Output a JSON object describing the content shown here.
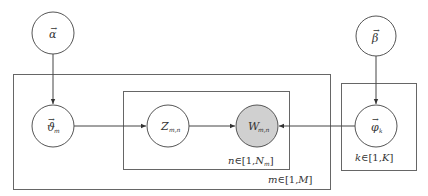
{
  "diagram": {
    "type": "plate-notation-graphical-model",
    "nodes": {
      "alpha": {
        "symbol": "α",
        "vector": true,
        "subscript": "",
        "observed": false
      },
      "beta": {
        "symbol": "β",
        "vector": true,
        "subscript": "",
        "observed": false
      },
      "theta": {
        "symbol": "ϑ",
        "vector": true,
        "subscript": "m",
        "observed": false
      },
      "z": {
        "symbol": "Z",
        "vector": false,
        "subscript": "m,n",
        "observed": false
      },
      "w": {
        "symbol": "W",
        "vector": false,
        "subscript": "m,n",
        "observed": true
      },
      "phi": {
        "symbol": "φ",
        "vector": true,
        "subscript": "k",
        "observed": false
      }
    },
    "vector_arrow": "→",
    "edges": [
      {
        "from": "alpha",
        "to": "theta"
      },
      {
        "from": "theta",
        "to": "z"
      },
      {
        "from": "z",
        "to": "w"
      },
      {
        "from": "beta",
        "to": "phi"
      },
      {
        "from": "phi",
        "to": "w"
      }
    ],
    "plates": {
      "outer": {
        "label_var": "m",
        "label_range": "∈[1,",
        "label_end": "M",
        "label_close": "]"
      },
      "inner": {
        "label_var": "n",
        "label_range": "∈[1,",
        "label_end": "N",
        "label_end_sub": "m",
        "label_close": "]"
      },
      "topic": {
        "label_var": "k",
        "label_range": "∈[1,",
        "label_end": "K",
        "label_close": "]"
      }
    },
    "colors": {
      "observed_fill": "#d0d0d0",
      "stroke": "#555555",
      "background": "#ffffff"
    }
  }
}
